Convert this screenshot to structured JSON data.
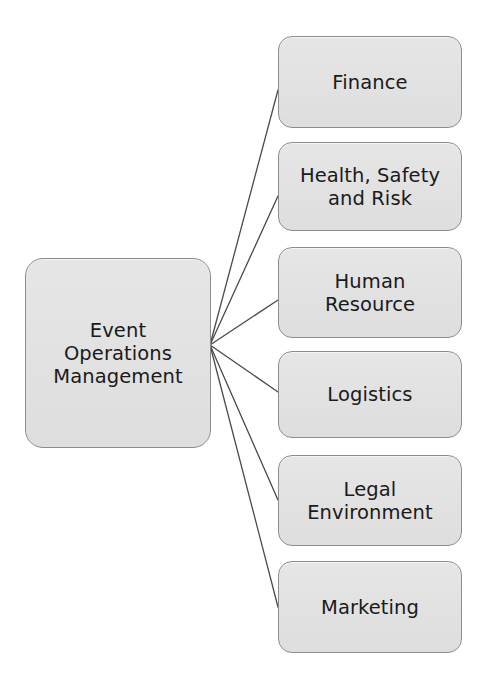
{
  "diagram": {
    "type": "hub-and-spoke",
    "title": "Event Operations Management",
    "root": {
      "id": "root",
      "label": "Event\nOperations\nManagement"
    },
    "branches": [
      {
        "id": "finance",
        "label": "Finance"
      },
      {
        "id": "health",
        "label": "Health, Safety\nand Risk"
      },
      {
        "id": "hr",
        "label": "Human\nResource"
      },
      {
        "id": "logistics",
        "label": "Logistics"
      },
      {
        "id": "legal",
        "label": "Legal\nEnvironment"
      },
      {
        "id": "marketing",
        "label": "Marketing"
      }
    ],
    "colors": {
      "node_fill": "#e2e2e2",
      "node_border": "#8d8d8d",
      "text": "#1a1a1a",
      "connector": "#4a4a4a",
      "background": "#ffffff"
    },
    "connectors": {
      "hub_x": 210,
      "hub_y": 345,
      "endpoints": [
        {
          "to": "finance",
          "x": 278,
          "y": 90
        },
        {
          "to": "health",
          "x": 278,
          "y": 196
        },
        {
          "to": "hr",
          "x": 278,
          "y": 300
        },
        {
          "to": "logistics",
          "x": 278,
          "y": 392
        },
        {
          "to": "legal",
          "x": 278,
          "y": 500
        },
        {
          "to": "marketing",
          "x": 278,
          "y": 607
        }
      ]
    }
  }
}
